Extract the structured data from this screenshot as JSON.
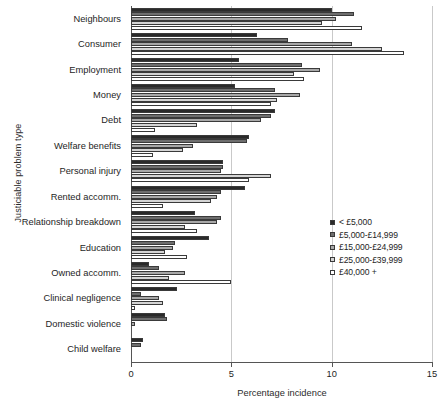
{
  "chart_data": {
    "type": "bar",
    "orientation": "horizontal",
    "title": "",
    "xlabel": "Percentage incidence",
    "ylabel": "Justiciable problem type",
    "xlim": [
      0,
      15
    ],
    "xticks": [
      0,
      5,
      10,
      15
    ],
    "xtick_labels": [
      "0",
      "5",
      "10",
      "15"
    ],
    "grid": "vertical",
    "legend_position": "right",
    "categories": [
      "Neighbours",
      "Consumer",
      "Employment",
      "Money",
      "Debt",
      "Welfare benefits",
      "Personal injury",
      "Rented accomm.",
      "Relationship breakdown",
      "Education",
      "Owned accomm.",
      "Clinical negligence",
      "Domestic violence",
      "Child welfare"
    ],
    "series": [
      {
        "name": "< £5,000",
        "color": "#2a2a2a",
        "values": [
          10.0,
          6.3,
          5.4,
          5.2,
          7.2,
          5.9,
          4.6,
          5.7,
          3.2,
          3.9,
          0.9,
          2.3,
          1.7,
          0.6
        ]
      },
      {
        "name": "£5,000-£14,999",
        "color": "#6e6e6e",
        "values": [
          11.1,
          7.8,
          8.5,
          7.2,
          7.0,
          5.8,
          4.6,
          4.5,
          4.5,
          2.2,
          1.4,
          0.5,
          1.8,
          0.5
        ]
      },
      {
        "name": "£15,000-£24,999",
        "color": "#a8a8a8",
        "values": [
          10.2,
          11.0,
          9.4,
          8.4,
          6.5,
          3.1,
          4.5,
          4.3,
          4.3,
          2.1,
          2.7,
          1.4,
          0.2,
          0.0
        ]
      },
      {
        "name": "£25,000-£39,999",
        "color": "#d4d4d4",
        "values": [
          9.5,
          12.5,
          8.1,
          7.3,
          3.3,
          2.6,
          7.0,
          4.0,
          2.7,
          1.7,
          1.9,
          1.6,
          0.0,
          0.0
        ]
      },
      {
        "name": "£40,000 +",
        "color": "#ffffff",
        "values": [
          11.5,
          13.6,
          8.6,
          7.0,
          1.2,
          1.1,
          5.9,
          1.6,
          3.3,
          2.8,
          5.0,
          0.2,
          0.0,
          0.0
        ]
      }
    ]
  },
  "legend": {
    "items": [
      {
        "label": "< £5,000",
        "swatch": "#2a2a2a"
      },
      {
        "label": "£5,000-£14,999",
        "swatch": "#6e6e6e"
      },
      {
        "label": "£15,000-£24,999",
        "swatch": "#a8a8a8"
      },
      {
        "label": "£25,000-£39,999",
        "swatch": "#d4d4d4"
      },
      {
        "label": "£40,000 +",
        "swatch": "#ffffff"
      }
    ]
  }
}
